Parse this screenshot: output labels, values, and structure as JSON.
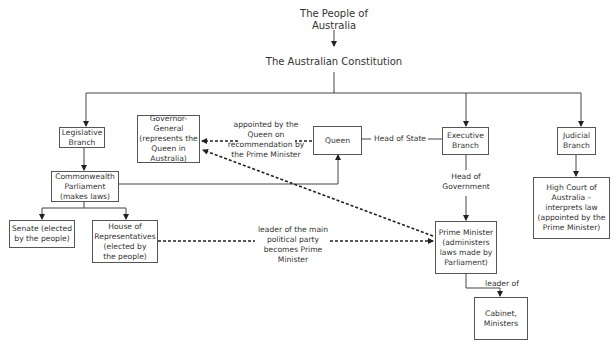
{
  "diagram": {
    "top": {
      "people": "The People of\nAustralia",
      "constitution": "The Australian Constitution"
    },
    "nodes": {
      "legislative": "Legislative\nBranch",
      "governor_general": "Governor-\nGeneral\n(represents the\nQueen in\nAustralia)",
      "queen": "Queen",
      "executive": "Executive\nBranch",
      "judicial": "Judicial\nBranch",
      "parliament": "Commonwealth\nParliament\n(makes laws)",
      "senate": "Senate (elected\nby the people)",
      "house": "House of\nRepresentatives\n(elected by\nthe people)",
      "high_court": "High Court of\nAustralia –\ninterprets law\n(appointed by the\nPrime Minister)",
      "prime_minister": "Prime Minister\n(administers\nlaws made by\nParliament)",
      "cabinet": "Cabinet,\nMinisters"
    },
    "edge_labels": {
      "appointed": "appointed by the\nQueen on\nrecommendation by\nthe Prime Minister",
      "head_of_state": "Head of State",
      "head_of_government": "Head of\nGovernment",
      "leader_party": "leader of the main\npolitical party\nbecomes Prime\nMinister",
      "leader_of": "leader of"
    },
    "colors": {
      "line": "#333333",
      "box_border": "#555555",
      "text": "#333333"
    }
  }
}
